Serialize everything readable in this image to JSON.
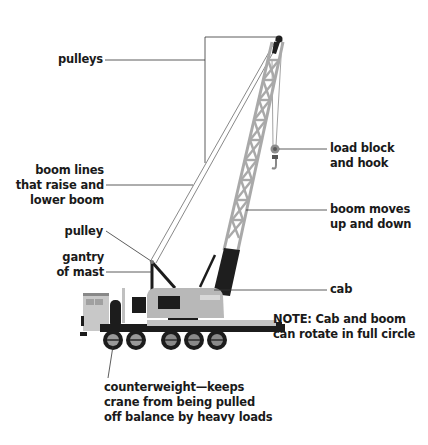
{
  "diagram": {
    "colors": {
      "boom_lattice": "#a9a9a9",
      "boom_base": "#1e1e1e",
      "cab_body": "#b8b8b8",
      "truck_dark": "#1c1c1c",
      "leader_line": "#333333",
      "text": "#1a1a1a",
      "background": "#ffffff"
    },
    "labels": {
      "pulleys": [
        "pulleys"
      ],
      "boom_lines": [
        "boom lines",
        "that raise and",
        "lower boom"
      ],
      "pulley": [
        "pulley"
      ],
      "gantry": [
        "gantry",
        "of mast"
      ],
      "load_block": [
        "load block",
        "and hook"
      ],
      "boom_moves": [
        "boom moves",
        "up and down"
      ],
      "cab": [
        "cab"
      ],
      "note": [
        "NOTE: Cab and boom",
        "can rotate in full circle"
      ],
      "counterweight": [
        "counterweight—keeps",
        "crane from being pulled",
        "off balance by heavy loads"
      ]
    },
    "wheels": {
      "count": 5
    }
  }
}
